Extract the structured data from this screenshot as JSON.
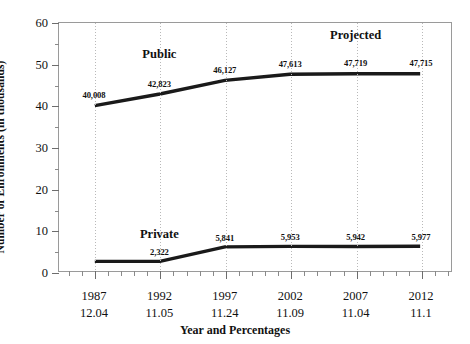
{
  "chart_data": {
    "type": "line",
    "title": "",
    "xlabel": "Year and Percentages",
    "ylabel": "Number of Enrollments (in thousands)",
    "ylim": [
      0,
      60
    ],
    "yticks": [
      0,
      10,
      20,
      30,
      40,
      50,
      60
    ],
    "ytick_labels": [
      "0",
      "10",
      "20",
      "30",
      "40",
      "50",
      "60"
    ],
    "grid": "vertical-dotted",
    "legend": "inline-labels",
    "categories": [
      "1987",
      "1992",
      "1997",
      "2002",
      "2007",
      "2012"
    ],
    "x_percentages": [
      "12.04",
      "11.05",
      "11.24",
      "11.09",
      "11.04",
      "11.1"
    ],
    "series": [
      {
        "name": "Public",
        "values": [
          40.008,
          42.823,
          46.127,
          47.613,
          47.719,
          47.715
        ],
        "data_labels": [
          "40,008",
          "42,823",
          "46,127",
          "47,613",
          "47,719",
          "47,715"
        ]
      },
      {
        "name": "Private",
        "values": [
          2.322,
          2.322,
          5.841,
          5.953,
          5.942,
          5.977
        ],
        "data_labels": [
          "2,322",
          "2,322",
          "5,841",
          "5,953",
          "5,942",
          "5,977"
        ]
      }
    ],
    "annotations": [
      {
        "text": "Public",
        "x_category": "1992",
        "y_value": 50.4
      },
      {
        "text": "Private",
        "x_category": "1992",
        "y_value": 7.2
      },
      {
        "text": "Projected",
        "x_category": "2007",
        "y_value": 55.0
      }
    ],
    "series_color": "#1a1a1a",
    "gridline_color": "#b9b9b9",
    "axis_color": "#9a9a9a"
  }
}
